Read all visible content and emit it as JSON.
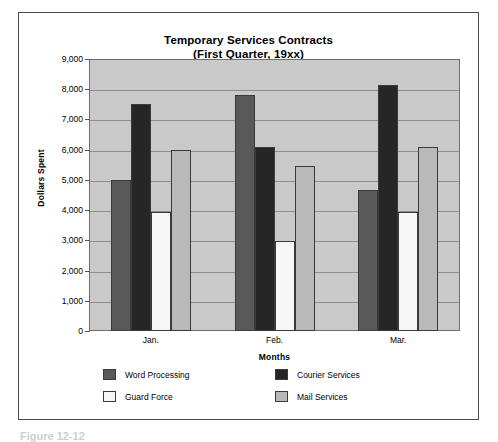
{
  "figure": {
    "caption": "Figure 12-12"
  },
  "chart_data": {
    "type": "bar",
    "title": "Temporary Services Contracts",
    "subtitle": "(First Quarter, 19xx)",
    "xlabel": "Months",
    "ylabel": "Dollars Spent",
    "categories": [
      "Jan.",
      "Feb.",
      "Mar."
    ],
    "ylim": [
      0,
      9000
    ],
    "ytick_step": 1000,
    "ytick_labels": [
      "9,000",
      "8,000",
      "7,000",
      "6,000",
      "5,000",
      "4,000",
      "3,000",
      "2,000",
      "1,000",
      "0"
    ],
    "grid": true,
    "legend_position": "bottom",
    "plot_background": "#c9c9c9",
    "series": [
      {
        "name": "Word Processing",
        "color": "#595959",
        "values": [
          5000,
          7800,
          4650
        ]
      },
      {
        "name": "Courier Services",
        "color": "#262626",
        "values": [
          7500,
          6100,
          8150
        ]
      },
      {
        "name": "Guard Force",
        "color": "#f7f7f7",
        "values": [
          3950,
          2980,
          3950
        ]
      },
      {
        "name": "Mail Services",
        "color": "#b9b9b9",
        "values": [
          5980,
          5450,
          6100
        ]
      }
    ]
  }
}
